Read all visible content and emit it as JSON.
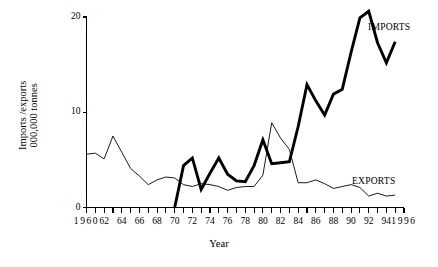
{
  "chart_data": {
    "type": "line",
    "title": "",
    "xlabel": "Year",
    "ylabel": "Imports /exports\n000,000 tonnes",
    "ylabel_line1": "Imports /exports",
    "ylabel_line2": "000,000 tonnes",
    "xlim": [
      1960,
      1996
    ],
    "ylim": [
      0,
      20
    ],
    "yticks": [
      0,
      10,
      20
    ],
    "ytick_labels": [
      "0",
      "10",
      "20"
    ],
    "xticks": [
      1960,
      1961,
      1962,
      1963,
      1964,
      1965,
      1966,
      1967,
      1968,
      1969,
      1970,
      1971,
      1972,
      1973,
      1974,
      1975,
      1976,
      1977,
      1978,
      1979,
      1980,
      1981,
      1982,
      1983,
      1984,
      1985,
      1986,
      1987,
      1988,
      1989,
      1990,
      1991,
      1992,
      1993,
      1994,
      1995,
      1996
    ],
    "xtick_labels": [
      "1960",
      "62",
      "64",
      "66",
      "68",
      "70",
      "72",
      "74",
      "76",
      "78",
      "80",
      "82",
      "84",
      "86",
      "88",
      "90",
      "92",
      "94",
      "1996"
    ],
    "xtick_label_years": [
      1960,
      1962,
      1964,
      1966,
      1968,
      1970,
      1972,
      1974,
      1976,
      1978,
      1980,
      1982,
      1984,
      1986,
      1988,
      1990,
      1992,
      1994,
      1996
    ],
    "grid": false,
    "legend_position": "inline-annotation",
    "line_color": "#000000",
    "series": [
      {
        "name": "IMPORTS",
        "style": "thick",
        "x": [
          1970,
          1971,
          1972,
          1973,
          1974,
          1975,
          1976,
          1977,
          1978,
          1979,
          1980,
          1981,
          1982,
          1983,
          1984,
          1985,
          1986,
          1987,
          1988,
          1989,
          1990,
          1991,
          1992,
          1993,
          1994,
          1995
        ],
        "values": [
          0.0,
          4.4,
          5.2,
          1.9,
          3.6,
          5.2,
          3.5,
          2.8,
          2.7,
          4.4,
          7.1,
          4.6,
          4.7,
          4.8,
          8.5,
          12.9,
          11.2,
          9.7,
          11.9,
          12.4,
          16.3,
          19.9,
          20.6,
          17.3,
          15.2,
          17.4
        ]
      },
      {
        "name": "EXPORTS",
        "style": "thin",
        "x": [
          1960,
          1961,
          1962,
          1963,
          1964,
          1965,
          1966,
          1967,
          1968,
          1969,
          1970,
          1971,
          1972,
          1973,
          1974,
          1975,
          1976,
          1977,
          1978,
          1979,
          1980,
          1981,
          1982,
          1983,
          1984,
          1985,
          1986,
          1987,
          1988,
          1989,
          1990,
          1991,
          1992,
          1993,
          1994,
          1995
        ],
        "values": [
          5.6,
          5.7,
          5.1,
          7.5,
          5.8,
          4.1,
          3.3,
          2.4,
          2.9,
          3.2,
          3.1,
          2.4,
          2.2,
          2.5,
          2.4,
          2.2,
          1.8,
          2.1,
          2.2,
          2.2,
          3.4,
          8.9,
          7.3,
          6.1,
          2.6,
          2.6,
          2.9,
          2.5,
          2.0,
          2.2,
          2.4,
          2.1,
          1.2,
          1.5,
          1.2,
          1.3
        ]
      }
    ],
    "annotations": [
      {
        "text": "IMPORTS",
        "x": 1993,
        "y": 19.0
      },
      {
        "text": "EXPORTS",
        "x": 1991,
        "y": 3.4
      }
    ]
  }
}
